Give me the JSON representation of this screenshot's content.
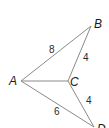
{
  "diagram": {
    "type": "geometry-figure",
    "vertices": [
      {
        "id": "A",
        "label": "A",
        "x": 21,
        "y": 81
      },
      {
        "id": "B",
        "label": "B",
        "x": 91,
        "y": 26
      },
      {
        "id": "C",
        "label": "C",
        "x": 68,
        "y": 81
      },
      {
        "id": "D",
        "label": "D",
        "x": 94,
        "y": 127
      }
    ],
    "edges": [
      {
        "from": "A",
        "to": "B",
        "length_label": "8"
      },
      {
        "from": "B",
        "to": "C",
        "length_label": "4"
      },
      {
        "from": "A",
        "to": "C",
        "length_label": ""
      },
      {
        "from": "C",
        "to": "D",
        "length_label": "4"
      },
      {
        "from": "A",
        "to": "D",
        "length_label": "6"
      }
    ],
    "labels": {
      "A": "A",
      "B": "B",
      "C": "C",
      "D": "D",
      "AB": "8",
      "BC": "4",
      "CD": "4",
      "AD": "6"
    },
    "colors": {
      "line": "#8a8a8a",
      "text": "#1a1a1a"
    }
  }
}
